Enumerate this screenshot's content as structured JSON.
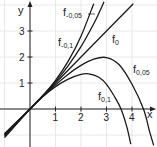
{
  "chart_data": {
    "type": "line",
    "title": "",
    "xlabel": "x",
    "ylabel": "y",
    "xlim": [
      -1.15,
      4.9
    ],
    "ylim": [
      -1.45,
      4.2
    ],
    "grid": true,
    "x_ticks": [
      "1",
      "2",
      "3",
      "4"
    ],
    "y_ticks": [
      "1",
      "2",
      "3"
    ],
    "legend_position": "inline labels on curves",
    "series": [
      {
        "name": "f-0,1",
        "label_main": "f",
        "label_sub": "-0,1",
        "points": [
          [
            -1,
            -1.1
          ],
          [
            0,
            0
          ],
          [
            0.5,
            0.51
          ],
          [
            1,
            1.1
          ],
          [
            1.5,
            1.84
          ],
          [
            2,
            2.8
          ],
          [
            2.5,
            4.05
          ]
        ]
      },
      {
        "name": "f-0,05",
        "label_main": "f",
        "label_sub": "-0,05",
        "points": [
          [
            -1,
            -1.05
          ],
          [
            0,
            0
          ],
          [
            0.5,
            0.51
          ],
          [
            1,
            1.05
          ],
          [
            1.5,
            1.67
          ],
          [
            2,
            2.4
          ],
          [
            2.5,
            3.28
          ],
          [
            2.75,
            3.79
          ],
          [
            2.9,
            4.12
          ]
        ]
      },
      {
        "name": "f0",
        "label_main": "f",
        "label_sub": "0",
        "points": [
          [
            -1,
            -1
          ],
          [
            0,
            0
          ],
          [
            4.05,
            4.05
          ]
        ]
      },
      {
        "name": "f0,05",
        "label_main": "f",
        "label_sub": "0,05",
        "points": [
          [
            -1,
            -0.97
          ],
          [
            0,
            0
          ],
          [
            0.5,
            0.49
          ],
          [
            1,
            0.93
          ],
          [
            1.5,
            1.34
          ],
          [
            2,
            1.68
          ],
          [
            2.5,
            1.92
          ],
          [
            3,
            1.98
          ],
          [
            3.5,
            1.7
          ],
          [
            4,
            0.95
          ],
          [
            4.45,
            0
          ],
          [
            4.7,
            -0.9
          ],
          [
            4.85,
            -1.4
          ]
        ]
      },
      {
        "name": "f0,1",
        "label_main": "f",
        "label_sub": "0,1",
        "points": [
          [
            -1,
            -0.95
          ],
          [
            0,
            0
          ],
          [
            0.5,
            0.47
          ],
          [
            1,
            0.86
          ],
          [
            1.5,
            1.15
          ],
          [
            2,
            1.33
          ],
          [
            2.3,
            1.35
          ],
          [
            2.7,
            1.22
          ],
          [
            3,
            0.95
          ],
          [
            3.3,
            0.5
          ],
          [
            3.57,
            0
          ],
          [
            3.8,
            -0.7
          ],
          [
            3.95,
            -1.35
          ]
        ]
      }
    ]
  },
  "axis": {
    "x_label": "x",
    "y_label": "y"
  },
  "labels": {
    "fm01": {
      "main": "f",
      "sub": "-0,1"
    },
    "fm005": {
      "main": "f",
      "sub": "-0,05"
    },
    "f0": {
      "main": "f",
      "sub": "0"
    },
    "f005": {
      "main": "f",
      "sub": "0,05"
    },
    "f01": {
      "main": "f",
      "sub": "0,1"
    }
  }
}
